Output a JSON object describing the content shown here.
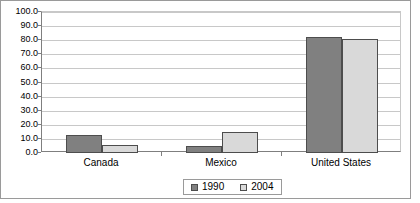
{
  "chart_data": {
    "type": "bar",
    "title": "",
    "subtitle": "",
    "xlabel": "",
    "ylabel": "",
    "categories": [
      "Canada",
      "Mexico",
      "United States"
    ],
    "series": [
      {
        "name": "1990",
        "color": "#808080",
        "values": [
          13.0,
          5.0,
          82.0
        ]
      },
      {
        "name": "2004",
        "color": "#d9d9d9",
        "values": [
          6.0,
          15.0,
          80.5
        ]
      }
    ],
    "ylim": [
      0.0,
      100.0
    ],
    "y_tick_step": 10.0,
    "y_tick_labels": [
      "100.0",
      "90.0",
      "80.0",
      "70.0",
      "60.0",
      "50.0",
      "40.0",
      "30.0",
      "20.0",
      "10.0",
      "0.0"
    ],
    "grid": true,
    "legend_position": "bottom",
    "legend_entries": [
      "1990",
      "2004"
    ]
  }
}
